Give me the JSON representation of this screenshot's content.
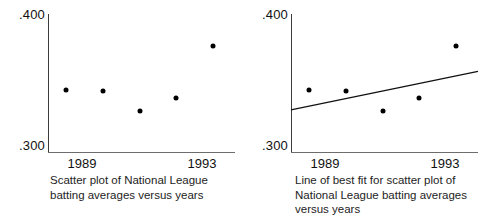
{
  "chart_data": [
    {
      "type": "scatter",
      "title": "",
      "caption": "Scatter plot of National League batting averages versus years",
      "xlabel": "",
      "ylabel": "",
      "x": [
        1989,
        1990,
        1991,
        1992,
        1993
      ],
      "y": [
        0.345,
        0.344,
        0.33,
        0.339,
        0.377
      ],
      "xlim": [
        1988.5,
        1993.6
      ],
      "ylim": [
        0.3,
        0.4
      ],
      "xticks": [
        1989,
        1993
      ],
      "xticklabels": [
        "1989",
        "1993"
      ],
      "yticks": [
        0.3,
        0.4
      ],
      "yticklabels": [
        ".300",
        ".400"
      ],
      "grid": false,
      "legend": false,
      "marker_color": "#000000"
    },
    {
      "type": "scatter",
      "title": "",
      "caption": "Line of best fit for scatter plot of National League batting averages versus years",
      "xlabel": "",
      "ylabel": "",
      "x": [
        1989,
        1990,
        1991,
        1992,
        1993
      ],
      "y": [
        0.345,
        0.344,
        0.33,
        0.339,
        0.377
      ],
      "xlim": [
        1988.5,
        1993.6
      ],
      "ylim": [
        0.3,
        0.4
      ],
      "xticks": [
        1989,
        1993
      ],
      "xticklabels": [
        "1989",
        "1993"
      ],
      "yticks": [
        0.3,
        0.4
      ],
      "yticklabels": [
        ".300",
        ".400"
      ],
      "grid": false,
      "legend": false,
      "marker_color": "#000000",
      "trendline": {
        "name": "line of best fit",
        "x_start": 1988.5,
        "y_start": 0.3305,
        "x_end": 1993.6,
        "y_end": 0.3585,
        "color": "#111111"
      }
    }
  ],
  "panels": [
    {
      "name": "scatter-plot",
      "y_top_label": ".400",
      "y_bottom_label": ".300",
      "x_tick_labels": [
        "1989",
        "1993"
      ],
      "caption": "Scatter plot of National League batting averages versus years"
    },
    {
      "name": "line-of-best-fit-plot",
      "y_top_label": ".400",
      "y_bottom_label": ".300",
      "x_tick_labels": [
        "1989",
        "1993"
      ],
      "caption": "Line of best fit for scatter plot of National League batting averages versus years"
    }
  ]
}
